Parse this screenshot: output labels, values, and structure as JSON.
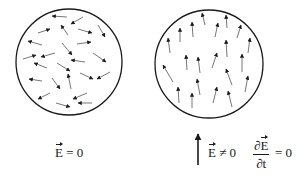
{
  "diagram": {
    "stroke_color": "#1a1a1a",
    "panels": [
      {
        "name": "random-field",
        "circle": {
          "cx": 69,
          "cy": 62,
          "r": 53
        },
        "arrows": [
          [
            67,
            17,
            52,
            16
          ],
          [
            83,
            17,
            71,
            24
          ],
          [
            38,
            33,
            50,
            29
          ],
          [
            68,
            35,
            61,
            25
          ],
          [
            78,
            29,
            92,
            33
          ],
          [
            98,
            25,
            105,
            37
          ],
          [
            42,
            45,
            28,
            41
          ],
          [
            77,
            44,
            91,
            42
          ],
          [
            23,
            59,
            36,
            55
          ],
          [
            55,
            53,
            41,
            57
          ],
          [
            62,
            43,
            72,
            55
          ],
          [
            93,
            53,
            106,
            62
          ],
          [
            85,
            62,
            71,
            60
          ],
          [
            47,
            68,
            34,
            63
          ],
          [
            57,
            63,
            70,
            71
          ],
          [
            80,
            73,
            93,
            79
          ],
          [
            110,
            72,
            97,
            79
          ],
          [
            42,
            81,
            29,
            79
          ],
          [
            71,
            89,
            68,
            74
          ],
          [
            52,
            78,
            60,
            89
          ],
          [
            50,
            93,
            38,
            99
          ],
          [
            87,
            93,
            73,
            99
          ],
          [
            56,
            103,
            70,
            107
          ],
          [
            92,
            103,
            78,
            103
          ]
        ],
        "label": {
          "E": "E",
          "rest": " = 0"
        }
      },
      {
        "name": "aligned-field",
        "circle": {
          "cx": 209,
          "cy": 64,
          "r": 54
        },
        "arrows": [
          [
            205,
            25,
            202,
            13
          ],
          [
            227,
            28,
            226,
            15
          ],
          [
            180,
            42,
            180,
            28
          ],
          [
            193,
            37,
            192,
            22
          ],
          [
            215,
            37,
            218,
            23
          ],
          [
            237,
            38,
            241,
            25
          ],
          [
            170,
            53,
            168,
            38
          ],
          [
            227,
            57,
            226,
            40
          ],
          [
            248,
            53,
            250,
            38
          ],
          [
            187,
            70,
            186,
            55
          ],
          [
            200,
            73,
            198,
            57
          ],
          [
            212,
            68,
            217,
            53
          ],
          [
            242,
            72,
            242,
            54
          ],
          [
            173,
            82,
            163,
            65
          ],
          [
            232,
            85,
            226,
            69
          ],
          [
            200,
            95,
            197,
            79
          ],
          [
            245,
            92,
            248,
            76
          ],
          [
            179,
            103,
            178,
            87
          ],
          [
            192,
            108,
            192,
            93
          ],
          [
            213,
            103,
            217,
            87
          ],
          [
            232,
            107,
            228,
            91
          ]
        ],
        "label": {
          "E": "E",
          "rest": " ≠ 0"
        },
        "big_arrow": [
          198,
          165,
          198,
          134
        ],
        "derivative": {
          "numerator_d": "∂",
          "numerator_E": "E",
          "denominator": "∂t",
          "rest": "= 0"
        }
      }
    ]
  }
}
